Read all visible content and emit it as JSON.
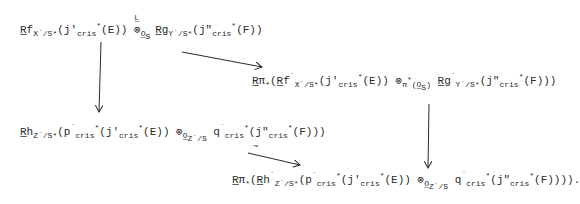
{
  "diagram": {
    "type": "commutative-diagram",
    "nodes": [
      {
        "id": "top_left",
        "text": "Rf_X·/S*(j'_cris*(E)) ⊗^L_{O_S} Rg_Y·/S*(j\"_cris*(F))",
        "x": 20,
        "y": 24
      },
      {
        "id": "mid_right",
        "text": "Rπ_*(Rf·_X·/S*(j'_cris*(E)) ⊗^L_{π*(O_S)} Rg·_Y·/S*(j\"_cris*(F)))",
        "x": 252,
        "y": 75
      },
      {
        "id": "mid_left",
        "text": "Rh_Z·/S*(p·_cris*(j'_cris*(E)) ⊗_{O_Z·/S} q·_cris*(j\"_cris*(F)))",
        "x": 20,
        "y": 124
      },
      {
        "id": "bottom_right",
        "text": "Rπ_*(Rh·_Z·/S*(p·_cris*(j'_cris*(E)) ⊗_{O_Z·/S} q·_cris*(j\"_cris*(F)))).",
        "x": 232,
        "y": 174
      }
    ],
    "arrows": [
      {
        "from": "top_left",
        "to": "mid_left",
        "label": ""
      },
      {
        "from": "top_left",
        "to": "mid_right",
        "label": ""
      },
      {
        "from": "mid_right",
        "to": "bottom_right",
        "label": ""
      },
      {
        "from": "mid_left",
        "to": "bottom_right",
        "label": "~"
      }
    ]
  }
}
